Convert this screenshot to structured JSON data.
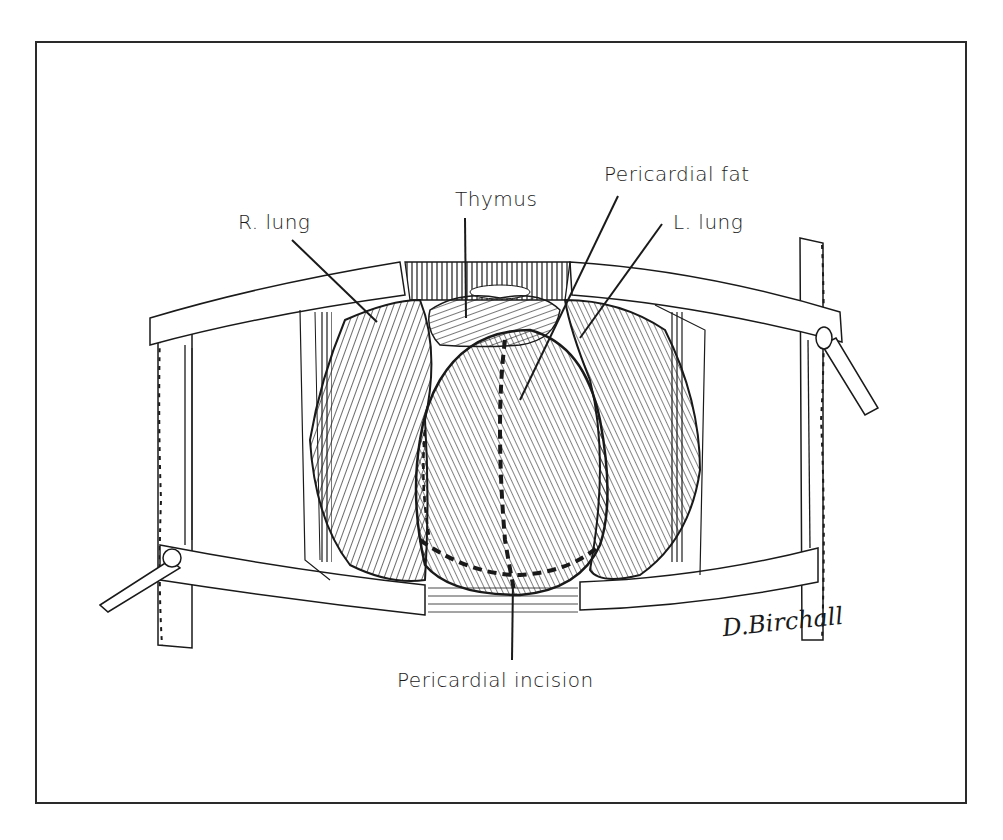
{
  "figure": {
    "labels": {
      "r_lung": "R. lung",
      "thymus": "Thymus",
      "pericardial_fat": "Pericardial fat",
      "l_lung": "L. lung",
      "pericardial_incision": "Pericardial incision"
    },
    "signature": "D.Birchall",
    "colors": {
      "ink": "#1a1a1a",
      "paper": "#ffffff",
      "frame": "#2a2a2a"
    }
  }
}
